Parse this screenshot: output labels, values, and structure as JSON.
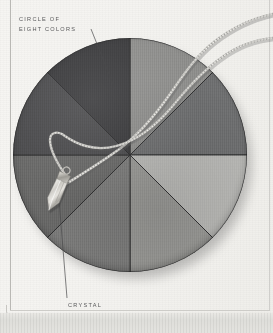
{
  "page": {
    "kind": "printed-page-scan",
    "background_color": "#f4f3f0",
    "rule_color": "#b9b8b4"
  },
  "captions": {
    "circle": {
      "line1": "CIRCLE OF",
      "line2": "EIGHT COLORS"
    },
    "crystal": {
      "line1": "CRYSTAL",
      "line2": "PENDULUM"
    },
    "text_color": "#58585a"
  },
  "disc": {
    "name": "circle-of-eight-colors",
    "center_x": 117,
    "center_y": 117,
    "radius": 117,
    "segment_count": 8,
    "segments": [
      {
        "index": 0,
        "label": "segment-n-ne",
        "start_deg": 0,
        "end_deg": 45,
        "tone": "#8e8e8c"
      },
      {
        "index": 1,
        "label": "segment-ne-e",
        "start_deg": 45,
        "end_deg": 90,
        "tone": "#6f7071"
      },
      {
        "index": 2,
        "label": "segment-e-se",
        "start_deg": 90,
        "end_deg": 135,
        "tone": "#b9b9b6"
      },
      {
        "index": 3,
        "label": "segment-se-s",
        "start_deg": 135,
        "end_deg": 180,
        "tone": "#9a9a97"
      },
      {
        "index": 4,
        "label": "segment-s-sw",
        "start_deg": 180,
        "end_deg": 225,
        "tone": "#7d7d7c"
      },
      {
        "index": 5,
        "label": "segment-sw-w",
        "start_deg": 225,
        "end_deg": 270,
        "tone": "#6a6a69"
      },
      {
        "index": 6,
        "label": "segment-w-nw",
        "start_deg": 270,
        "end_deg": 315,
        "tone": "#4c4c4e"
      },
      {
        "index": 7,
        "label": "segment-nw-n",
        "start_deg": 315,
        "end_deg": 360,
        "tone": "#3b3b3d"
      }
    ],
    "divider_color": "#2c2c2e"
  },
  "pendulum": {
    "name": "crystal-pendulum",
    "chain_color": "#d7d6d2",
    "chain_shadow": "#5d5d5d",
    "crystal_body": "#cfcdc8",
    "crystal_cap": "#b4b2ac",
    "crystal_x": 57,
    "crystal_y": 192
  },
  "leaders": {
    "circle": {
      "x1": 91,
      "y1": 29,
      "x2": 115,
      "y2": 89
    },
    "crystal": {
      "x1": 67,
      "y1": 298,
      "x2": 59,
      "y2": 200
    },
    "color": "#4a4a4c"
  }
}
